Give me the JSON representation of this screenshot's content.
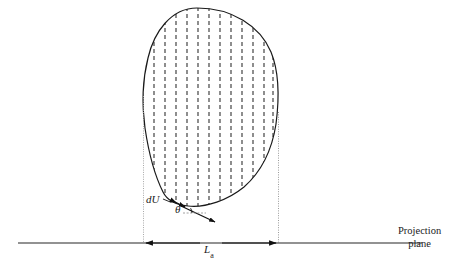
{
  "figure": {
    "domain_kind": "technical-line-diagram",
    "background_color": "#ffffff",
    "ink_color": "#1a1a1a",
    "guide_color": "#9a9a9a",
    "axis_color": "#6e6e6e",
    "hatch_color": "#3a3a3a",
    "width": 460,
    "height": 270
  },
  "labels": {
    "du": "d",
    "du_italic": "U",
    "du_full": "dU",
    "theta": "θ",
    "length_symbol": "L",
    "length_subscript": "a",
    "length_full": "La",
    "projection_plane_line1": "Projection",
    "projection_plane_line2": "plane",
    "caption": ""
  },
  "geometry": {
    "body_outline_note": "closed convex blob, widest near upper-middle, tapering to a point at lower-left",
    "body_top_y": 8,
    "body_bottom_y": 205,
    "body_left_x": 143,
    "body_right_x": 279,
    "hatch_line_count": 12,
    "hatch_spacing_px": 11,
    "hatch_dash": "4 3",
    "left_guide_x": 143,
    "right_guide_x": 278,
    "baseline_y": 243,
    "baseline_left_x": 18,
    "baseline_right_x": 422,
    "dimension_arrow_left_x": 143,
    "dimension_arrow_right_x": 278,
    "normal_vector_from": [
      182,
      206
    ],
    "normal_vector_to": [
      214,
      221
    ],
    "du_tick_from": [
      172,
      201
    ],
    "du_tick_to": [
      184,
      207
    ]
  },
  "annotations": {
    "du_position": {
      "x": 149,
      "y": 199
    },
    "theta_position": {
      "x": 178,
      "y": 210
    },
    "la_position": {
      "x": 205,
      "y": 246
    },
    "projection_plane_position": {
      "x": 399,
      "y": 228
    },
    "caption_position": {
      "x": 2,
      "y": 259
    }
  }
}
